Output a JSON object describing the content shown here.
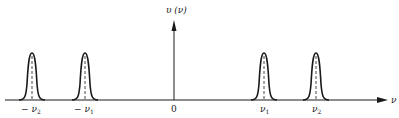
{
  "figure": {
    "y_axis_label": "υ (ν)",
    "x_axis_label": "ν",
    "origin_label": "0",
    "ticks": [
      {
        "id": "neg-nu2",
        "sign": "−",
        "symbol": "ν",
        "sub": "2",
        "x": 32
      },
      {
        "id": "neg-nu1",
        "sign": "−",
        "symbol": "ν",
        "sub": "1",
        "x": 85
      },
      {
        "id": "nu1",
        "sign": "",
        "symbol": "ν",
        "sub": "1",
        "x": 264
      },
      {
        "id": "nu2",
        "sign": "",
        "symbol": "ν",
        "sub": "2",
        "x": 316
      }
    ],
    "peaks": [
      {
        "center_x": 32,
        "label": "−ν2"
      },
      {
        "center_x": 85,
        "label": "−ν1"
      },
      {
        "center_x": 264,
        "label": "ν1"
      },
      {
        "center_x": 316,
        "label": "ν2"
      }
    ],
    "colors": {
      "ink": "#1a1a1a",
      "background": "#ffffff"
    }
  }
}
